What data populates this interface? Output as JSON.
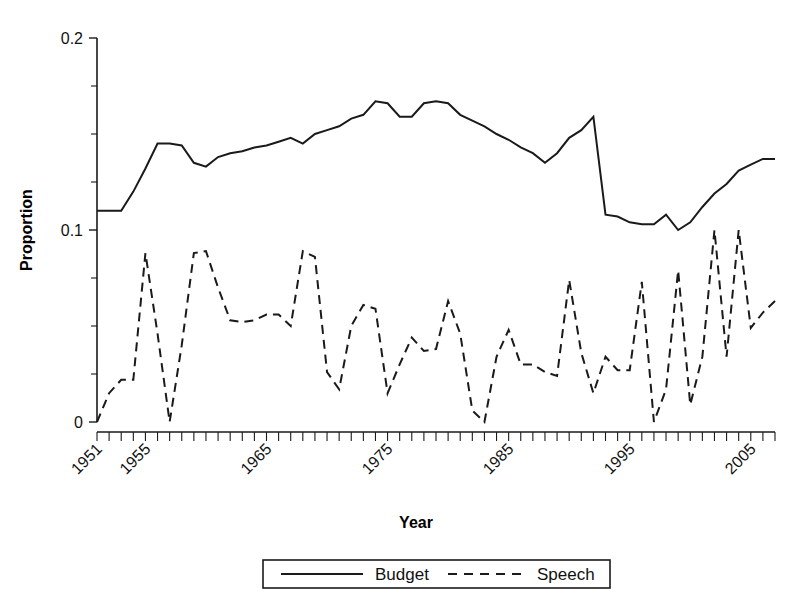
{
  "chart_data": {
    "type": "line",
    "title": "",
    "xlabel": "Year",
    "ylabel": "Proportion",
    "xlim": [
      1951,
      2007
    ],
    "ylim": [
      0,
      0.2
    ],
    "grid": false,
    "legend_position": "bottom",
    "y_tick_labels": [
      "0",
      "0.1",
      "0.2"
    ],
    "y_tick_values": [
      0,
      0.1,
      0.2
    ],
    "y_minor_tick_values": [
      0.025,
      0.05,
      0.075,
      0.125,
      0.15,
      0.175
    ],
    "x_tick_labels": [
      "1951",
      "1955",
      "1965",
      "1975",
      "1985",
      "1995",
      "2005"
    ],
    "x_tick_values": [
      1951,
      1955,
      1965,
      1975,
      1985,
      1995,
      2005
    ],
    "x_minor_tick_step": 1,
    "x_tick_label_rotation": 45,
    "x": [
      1951,
      1952,
      1953,
      1954,
      1955,
      1956,
      1957,
      1958,
      1959,
      1960,
      1961,
      1962,
      1963,
      1964,
      1965,
      1966,
      1967,
      1968,
      1969,
      1970,
      1971,
      1972,
      1973,
      1974,
      1975,
      1976,
      1977,
      1978,
      1979,
      1980,
      1981,
      1982,
      1983,
      1984,
      1985,
      1986,
      1987,
      1988,
      1989,
      1990,
      1991,
      1992,
      1993,
      1994,
      1995,
      1996,
      1997,
      1998,
      1999,
      2000,
      2001,
      2002,
      2003,
      2004,
      2005,
      2006,
      2007
    ],
    "series": [
      {
        "name": "Budget",
        "style": "solid",
        "color": "#1a1a1a",
        "values": [
          0.11,
          0.11,
          0.11,
          0.12,
          0.132,
          0.145,
          0.145,
          0.144,
          0.135,
          0.133,
          0.138,
          0.14,
          0.141,
          0.143,
          0.144,
          0.146,
          0.148,
          0.145,
          0.15,
          0.152,
          0.154,
          0.158,
          0.16,
          0.167,
          0.166,
          0.159,
          0.159,
          0.166,
          0.167,
          0.166,
          0.16,
          0.157,
          0.154,
          0.15,
          0.147,
          0.143,
          0.14,
          0.135,
          0.14,
          0.148,
          0.152,
          0.159,
          0.108,
          0.107,
          0.104,
          0.103,
          0.103,
          0.108,
          0.1,
          0.104,
          0.112,
          0.119,
          0.124,
          0.131,
          0.134,
          0.137,
          0.137
        ]
      },
      {
        "name": "Speech",
        "style": "dashed",
        "color": "#1a1a1a",
        "values": [
          0.0,
          0.015,
          0.022,
          0.022,
          0.088,
          0.046,
          0.0,
          0.04,
          0.088,
          0.089,
          0.07,
          0.053,
          0.052,
          0.053,
          0.056,
          0.056,
          0.05,
          0.089,
          0.086,
          0.026,
          0.017,
          0.05,
          0.061,
          0.059,
          0.015,
          0.03,
          0.044,
          0.037,
          0.038,
          0.063,
          0.046,
          0.006,
          0.0,
          0.034,
          0.048,
          0.03,
          0.03,
          0.026,
          0.024,
          0.074,
          0.036,
          0.015,
          0.034,
          0.027,
          0.027,
          0.073,
          0.0,
          0.017,
          0.079,
          0.009,
          0.034,
          0.1,
          0.034,
          0.1,
          0.049,
          0.057,
          0.063
        ]
      }
    ]
  },
  "legend": {
    "entries": [
      {
        "label": "Budget",
        "style": "solid"
      },
      {
        "label": "Speech",
        "style": "dashed"
      }
    ]
  }
}
